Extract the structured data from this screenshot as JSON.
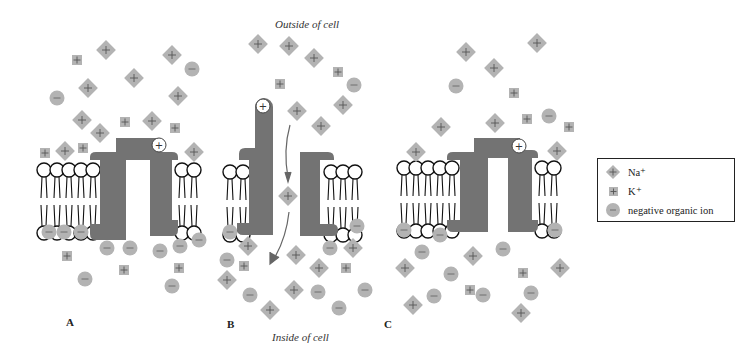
{
  "captions": {
    "outside": "Outside of cell",
    "inside": "Inside of cell"
  },
  "panels": [
    {
      "label": "A",
      "label_pos": [
        70,
        298
      ]
    },
    {
      "label": "B",
      "label_pos": [
        228,
        298
      ]
    },
    {
      "label": "C",
      "label_pos": [
        387,
        298
      ]
    }
  ],
  "legend": {
    "items": [
      {
        "symbol": "diamond",
        "label": "Na⁺"
      },
      {
        "symbol": "square",
        "label": "K⁺"
      },
      {
        "symbol": "circle",
        "label": "negative organic ion"
      }
    ]
  },
  "colors": {
    "ion_fill": "#b3b3b3",
    "ion_mark": "#555555",
    "protein": "#737373",
    "lipid_stroke": "#111111"
  },
  "ions": {
    "A": {
      "na": [
        [
          106,
          50
        ],
        [
          172,
          55
        ],
        [
          178,
          96
        ],
        [
          88,
          88
        ],
        [
          134,
          78
        ],
        [
          82,
          120
        ],
        [
          100,
          133
        ],
        [
          152,
          121
        ],
        [
          65,
          151
        ],
        [
          194,
          152
        ]
      ],
      "k": [
        [
          77,
          60
        ],
        [
          125,
          122
        ],
        [
          175,
          128
        ],
        [
          45,
          153
        ],
        [
          83,
          148
        ]
      ],
      "neg": [
        [
          192,
          69
        ],
        [
          57,
          98
        ],
        [
          49,
          232
        ],
        [
          64,
          232
        ],
        [
          81,
          232
        ],
        [
          107,
          248
        ],
        [
          130,
          248
        ],
        [
          160,
          251
        ],
        [
          180,
          246
        ],
        [
          199,
          240
        ],
        [
          85,
          279
        ],
        [
          172,
          286
        ]
      ],
      "kin": [
        [
          67,
          256
        ],
        [
          124,
          270
        ],
        [
          179,
          268
        ]
      ]
    },
    "B": {
      "na": [
        [
          258,
          44
        ],
        [
          289,
          46
        ],
        [
          314,
          58
        ],
        [
          343,
          105
        ],
        [
          297,
          111
        ],
        [
          321,
          126
        ],
        [
          288,
          196
        ],
        [
          248,
          246
        ],
        [
          296,
          255
        ],
        [
          319,
          268
        ],
        [
          227,
          280
        ],
        [
          294,
          290
        ],
        [
          270,
          310
        ],
        [
          353,
          248
        ]
      ],
      "k": [
        [
          338,
          72
        ],
        [
          280,
          84
        ],
        [
          244,
          266
        ],
        [
          346,
          268
        ]
      ],
      "neg": [
        [
          354,
          85
        ],
        [
          230,
          232
        ],
        [
          227,
          260
        ],
        [
          357,
          226
        ],
        [
          330,
          248
        ],
        [
          250,
          295
        ],
        [
          318,
          292
        ],
        [
          339,
          308
        ],
        [
          365,
          290
        ]
      ],
      "kin": []
    },
    "C": {
      "na": [
        [
          466,
          52
        ],
        [
          537,
          43
        ],
        [
          494,
          68
        ],
        [
          441,
          127
        ],
        [
          495,
          123
        ],
        [
          557,
          151
        ],
        [
          416,
          152
        ],
        [
          473,
          256
        ],
        [
          405,
          268
        ],
        [
          560,
          268
        ],
        [
          413,
          305
        ],
        [
          521,
          313
        ]
      ],
      "k": [
        [
          514,
          93
        ],
        [
          527,
          119
        ],
        [
          569,
          127
        ],
        [
          470,
          290
        ],
        [
          523,
          273
        ]
      ],
      "neg": [
        [
          456,
          86
        ],
        [
          549,
          116
        ],
        [
          404,
          230
        ],
        [
          440,
          235
        ],
        [
          422,
          252
        ],
        [
          503,
          249
        ],
        [
          451,
          274
        ],
        [
          555,
          230
        ],
        [
          434,
          296
        ],
        [
          483,
          295
        ],
        [
          531,
          293
        ]
      ],
      "kin": []
    }
  }
}
